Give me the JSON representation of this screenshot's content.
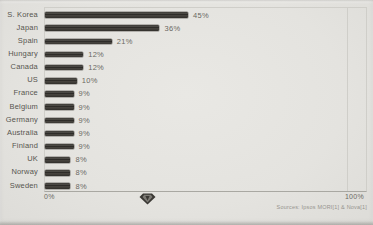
{
  "chart_data": {
    "type": "bar",
    "orientation": "horizontal",
    "title": "",
    "xlabel": "",
    "ylabel": "",
    "categories": [
      "S. Korea",
      "Japan",
      "Spain",
      "Hungary",
      "Canada",
      "US",
      "France",
      "Belgium",
      "Germany",
      "Australia",
      "Finland",
      "UK",
      "Norway",
      "Sweden"
    ],
    "values": [
      45,
      36,
      21,
      12,
      12,
      10,
      9,
      9,
      9,
      9,
      9,
      8,
      8,
      8
    ],
    "value_labels": [
      "45%",
      "36%",
      "21%",
      "12%",
      "12%",
      "10%",
      "9%",
      "9%",
      "9%",
      "9%",
      "9%",
      "8%",
      "8%",
      "8%"
    ],
    "xlim": [
      0,
      100
    ],
    "x_ticks": [
      "0%",
      "100%"
    ],
    "grid": "single vertical gridline at 100%",
    "legend": "none",
    "source": "Sources: Ipsos MORI[1] & Nova[1]"
  },
  "icons": {
    "diamond_marker": "gem-diamond-icon"
  },
  "colors": {
    "background": "#e5e4e0",
    "bar": "#35332f",
    "label_text": "#57554f",
    "value_text": "#6b6963",
    "gridline": "#cfcec9",
    "axis": "#a9a8a2",
    "source_text": "#96948e"
  }
}
